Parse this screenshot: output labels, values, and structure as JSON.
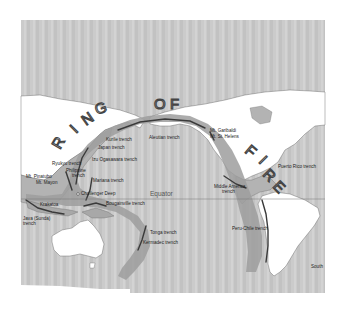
{
  "title_letters": [
    "R",
    "I",
    "N",
    "G",
    "O",
    "F",
    "F",
    "I",
    "R",
    "E"
  ],
  "title_text": "RING OF FIRE",
  "equator_label": "Equator",
  "colors": {
    "ocean": "#c9c9c9",
    "land": "#ffffff",
    "land_shaded": "#b3b3b3",
    "ring_band": "#9a9a9a",
    "trench_line": "#3a3a3a"
  },
  "labels": {
    "kurile": "Kurile trench",
    "japan": "Japan trench",
    "izu": "Izu Ogasawara trench",
    "ryukyu": "Ryukyu trench",
    "philippine": "Philippine",
    "philippine2": "trench",
    "mariana": "Mariana trench",
    "pinatubo": "Mt. Pinatubo",
    "mayon": "Mt. Mayon",
    "challenger": "Challenger Deep",
    "krakatoa": "Krakatoa",
    "sunda": "Java (Sunda)",
    "sunda2": "trench",
    "bougainville": "Bougainville trench",
    "tonga": "Tonga trench",
    "kermadec": "Kermadec trench",
    "aleutian": "Aleutian trench",
    "garibaldi": "Mt. Garibaldi",
    "st_helens": "Mt. St. Helens",
    "middle_america": "Middle America",
    "middle_america2": "trench",
    "puerto_rico": "Puerto Rico trench",
    "peru_chile": "Peru-Chile trench",
    "south": "South"
  }
}
